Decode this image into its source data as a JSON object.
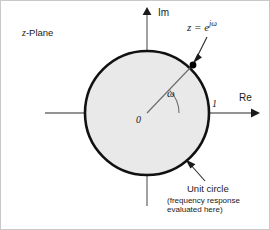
{
  "figure": {
    "plane_label_var": "z",
    "plane_label_rest": "-Plane",
    "axes": {
      "imaginary_label": "Im",
      "real_label": "Re",
      "origin_label": "0",
      "unit_tick_label": "1"
    },
    "angle_label": "ω",
    "point_equation_lhs": "z",
    "point_equation_eq": " = ",
    "point_equation_base": "e",
    "point_equation_exp": "jω",
    "annotation": {
      "title": "Unit circle",
      "note_line_1": "(frequency response",
      "note_line_2": "evaluated here)"
    },
    "colors": {
      "circle_stroke": "#111111",
      "circle_fill": "#e9e9e9",
      "axis": "#6f6f6f",
      "text": "#1a1a1a",
      "leader": "#2a2a2a",
      "marker": "#000000",
      "border": "#c9c9c9"
    },
    "geometry": {
      "center_x": 146,
      "center_y": 112,
      "radius": 62,
      "point_angle_deg": 46
    }
  }
}
